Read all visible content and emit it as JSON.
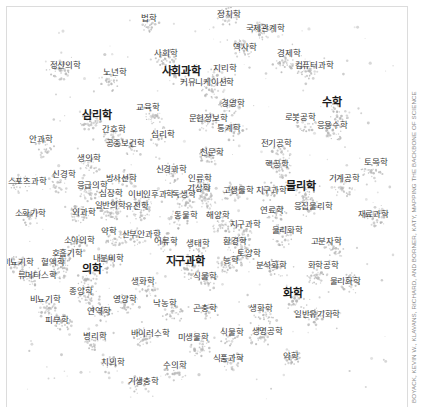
{
  "credit": "BOYACK, KEVIN W., KLAVANS, RICHARD, AND BORNER, KATY, MAPPING THE BACKBONE OF SCIENCE",
  "colors": {
    "background": "#ffffff",
    "cluster": "#b4b4b4",
    "label": "#3a3a3a",
    "major_label": "#1a1a1a"
  },
  "labels": [
    {
      "text": "법학",
      "x": 148,
      "y": 17,
      "major": false
    },
    {
      "text": "정치학",
      "x": 228,
      "y": 13,
      "major": false
    },
    {
      "text": "국제관계학",
      "x": 264,
      "y": 27,
      "major": false
    },
    {
      "text": "사회학",
      "x": 165,
      "y": 52,
      "major": false
    },
    {
      "text": "역사학",
      "x": 244,
      "y": 46,
      "major": false
    },
    {
      "text": "경제학",
      "x": 288,
      "y": 52,
      "major": false
    },
    {
      "text": "정신의학",
      "x": 64,
      "y": 64,
      "major": false
    },
    {
      "text": "노년학",
      "x": 114,
      "y": 71,
      "major": false
    },
    {
      "text": "사회과학",
      "x": 180,
      "y": 70,
      "major": true
    },
    {
      "text": "지리학",
      "x": 224,
      "y": 67,
      "major": false
    },
    {
      "text": "컴퓨터과학",
      "x": 313,
      "y": 64,
      "major": false
    },
    {
      "text": "커뮤니케이션학",
      "x": 206,
      "y": 81,
      "major": false
    },
    {
      "text": "심리학",
      "x": 96,
      "y": 114,
      "major": true
    },
    {
      "text": "교육학",
      "x": 147,
      "y": 106,
      "major": false
    },
    {
      "text": "경영학",
      "x": 232,
      "y": 102,
      "major": false
    },
    {
      "text": "수학",
      "x": 331,
      "y": 101,
      "major": true
    },
    {
      "text": "로봇공학",
      "x": 299,
      "y": 116,
      "major": false
    },
    {
      "text": "응용수학",
      "x": 331,
      "y": 124,
      "major": false
    },
    {
      "text": "문헌정보학",
      "x": 207,
      "y": 117,
      "major": false
    },
    {
      "text": "간호학",
      "x": 113,
      "y": 128,
      "major": false
    },
    {
      "text": "통계학",
      "x": 228,
      "y": 127,
      "major": false
    },
    {
      "text": "안과학",
      "x": 40,
      "y": 138,
      "major": false
    },
    {
      "text": "심리학",
      "x": 162,
      "y": 133,
      "major": false
    },
    {
      "text": "전기공학",
      "x": 275,
      "y": 142,
      "major": false
    },
    {
      "text": "공중보건학",
      "x": 124,
      "y": 142,
      "major": false
    },
    {
      "text": "천문학",
      "x": 211,
      "y": 151,
      "major": false
    },
    {
      "text": "생의학",
      "x": 88,
      "y": 157,
      "major": false
    },
    {
      "text": "핵공학",
      "x": 276,
      "y": 163,
      "major": false
    },
    {
      "text": "토목학",
      "x": 375,
      "y": 161,
      "major": false
    },
    {
      "text": "신경과학",
      "x": 170,
      "y": 168,
      "major": false
    },
    {
      "text": "신경학",
      "x": 63,
      "y": 173,
      "major": false
    },
    {
      "text": "방사선학",
      "x": 120,
      "y": 177,
      "major": false
    },
    {
      "text": "인류학",
      "x": 199,
      "y": 177,
      "major": false
    },
    {
      "text": "기계공학",
      "x": 343,
      "y": 177,
      "major": false
    },
    {
      "text": "스포츠과학",
      "x": 26,
      "y": 180,
      "major": false
    },
    {
      "text": "응급의학",
      "x": 91,
      "y": 184,
      "major": false
    },
    {
      "text": "물리학",
      "x": 300,
      "y": 185,
      "major": true
    },
    {
      "text": "기상학",
      "x": 198,
      "y": 187,
      "major": false
    },
    {
      "text": "고생물학",
      "x": 237,
      "y": 189,
      "major": false
    },
    {
      "text": "지구과학",
      "x": 270,
      "y": 189,
      "major": false
    },
    {
      "text": "심장학",
      "x": 110,
      "y": 192,
      "major": false
    },
    {
      "text": "이비인후과학",
      "x": 150,
      "y": 193,
      "major": false
    },
    {
      "text": "독생학",
      "x": 183,
      "y": 193,
      "major": false
    },
    {
      "text": "응집물리학",
      "x": 312,
      "y": 205,
      "major": false
    },
    {
      "text": "일반의학",
      "x": 109,
      "y": 204,
      "major": false
    },
    {
      "text": "유전학",
      "x": 136,
      "y": 205,
      "major": false
    },
    {
      "text": "연료학",
      "x": 271,
      "y": 209,
      "major": false
    },
    {
      "text": "소화기학",
      "x": 29,
      "y": 212,
      "major": false
    },
    {
      "text": "외과학",
      "x": 83,
      "y": 211,
      "major": false
    },
    {
      "text": "동물학",
      "x": 185,
      "y": 214,
      "major": false
    },
    {
      "text": "해양학",
      "x": 217,
      "y": 214,
      "major": false
    },
    {
      "text": "재료과학",
      "x": 372,
      "y": 213,
      "major": false
    },
    {
      "text": "지구과학",
      "x": 244,
      "y": 223,
      "major": false
    },
    {
      "text": "약학",
      "x": 108,
      "y": 230,
      "major": false
    },
    {
      "text": "산부인과학",
      "x": 140,
      "y": 233,
      "major": false
    },
    {
      "text": "물리화학",
      "x": 286,
      "y": 229,
      "major": false
    },
    {
      "text": "소아의학",
      "x": 78,
      "y": 239,
      "major": false
    },
    {
      "text": "어류학",
      "x": 165,
      "y": 240,
      "major": false
    },
    {
      "text": "생태학",
      "x": 197,
      "y": 242,
      "major": false
    },
    {
      "text": "환경학",
      "x": 234,
      "y": 240,
      "major": false
    },
    {
      "text": "고분자학",
      "x": 325,
      "y": 240,
      "major": false
    },
    {
      "text": "호흡기학",
      "x": 66,
      "y": 252,
      "major": false
    },
    {
      "text": "토양학",
      "x": 248,
      "y": 252,
      "major": false
    },
    {
      "text": "비뇨기학",
      "x": 17,
      "y": 261,
      "major": false
    },
    {
      "text": "혈액학",
      "x": 52,
      "y": 261,
      "major": false
    },
    {
      "text": "내분비학",
      "x": 107,
      "y": 257,
      "major": false
    },
    {
      "text": "지구과학",
      "x": 184,
      "y": 260,
      "major": true
    },
    {
      "text": "농학",
      "x": 230,
      "y": 259,
      "major": false
    },
    {
      "text": "분석화학",
      "x": 270,
      "y": 264,
      "major": false
    },
    {
      "text": "화학공학",
      "x": 322,
      "y": 264,
      "major": false
    },
    {
      "text": "의학",
      "x": 91,
      "y": 268,
      "major": true
    },
    {
      "text": "류머티스학",
      "x": 36,
      "y": 274,
      "major": false
    },
    {
      "text": "식물학",
      "x": 204,
      "y": 275,
      "major": false
    },
    {
      "text": "물리화학",
      "x": 344,
      "y": 280,
      "major": false
    },
    {
      "text": "생화학",
      "x": 142,
      "y": 280,
      "major": false
    },
    {
      "text": "종양학",
      "x": 80,
      "y": 290,
      "major": false
    },
    {
      "text": "화학",
      "x": 292,
      "y": 292,
      "major": true
    },
    {
      "text": "비뇨기학",
      "x": 44,
      "y": 298,
      "major": false
    },
    {
      "text": "영양학",
      "x": 124,
      "y": 298,
      "major": false
    },
    {
      "text": "낙농학",
      "x": 164,
      "y": 302,
      "major": false
    },
    {
      "text": "생화학",
      "x": 260,
      "y": 307,
      "major": false
    },
    {
      "text": "곤충학",
      "x": 204,
      "y": 307,
      "major": false
    },
    {
      "text": "일반유기화학",
      "x": 316,
      "y": 313,
      "major": false
    },
    {
      "text": "연역학",
      "x": 98,
      "y": 310,
      "major": false
    },
    {
      "text": "피부학",
      "x": 56,
      "y": 319,
      "major": false
    },
    {
      "text": "식물학",
      "x": 231,
      "y": 331,
      "major": false
    },
    {
      "text": "생명공학",
      "x": 266,
      "y": 330,
      "major": false
    },
    {
      "text": "병리학",
      "x": 94,
      "y": 335,
      "major": false
    },
    {
      "text": "바이러스학",
      "x": 149,
      "y": 332,
      "major": false
    },
    {
      "text": "미생물학",
      "x": 192,
      "y": 336,
      "major": false
    },
    {
      "text": "치의학",
      "x": 112,
      "y": 361,
      "major": false
    },
    {
      "text": "식품과학",
      "x": 227,
      "y": 357,
      "major": false
    },
    {
      "text": "약학",
      "x": 290,
      "y": 355,
      "major": false
    },
    {
      "text": "수의학",
      "x": 174,
      "y": 364,
      "major": false
    },
    {
      "text": "기생충학",
      "x": 142,
      "y": 380,
      "major": false
    }
  ]
}
